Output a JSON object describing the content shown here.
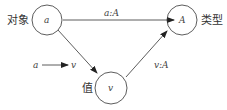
{
  "nodes": {
    "object": {
      "label": "对象",
      "symbol": "a"
    },
    "type": {
      "label": "类型",
      "symbol": "A"
    },
    "value": {
      "label": "值",
      "symbol": "v"
    }
  },
  "edges": {
    "object_to_type": "a:A",
    "value_to_type": "v:A",
    "object_to_value": ""
  },
  "legend": {
    "from": "a",
    "to": "v"
  },
  "colors": {
    "stroke": "#333333",
    "text": "#333333"
  }
}
